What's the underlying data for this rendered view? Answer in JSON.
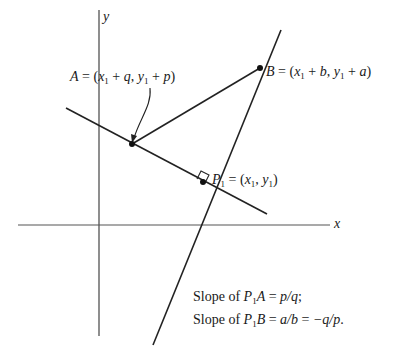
{
  "figure": {
    "axes": {
      "x_label": "x",
      "y_label": "y"
    },
    "points": {
      "A": {
        "name": "A",
        "x_expr": "x",
        "x_sub": "1",
        "x_plus": "q",
        "y_expr": "y",
        "y_sub": "1",
        "y_plus": "p"
      },
      "B": {
        "name": "B",
        "x_expr": "x",
        "x_sub": "1",
        "x_plus": "b",
        "y_expr": "y",
        "y_sub": "1",
        "y_plus": "a"
      },
      "P1": {
        "name": "P",
        "name_sub": "1",
        "x_expr": "x",
        "x_sub": "1",
        "y_expr": "y",
        "y_sub": "1"
      }
    },
    "annotations": {
      "line1": {
        "prefix": "Slope of ",
        "seg_P": "P",
        "seg_sub": "1",
        "seg_end": "A",
        "eq": " = ",
        "value": "p/q",
        "suffix": ";"
      },
      "line2": {
        "prefix": "Slope of ",
        "seg_P": "P",
        "seg_sub": "1",
        "seg_end": "B",
        "eq": " = ",
        "value1": "a/b",
        "eq2": " = ",
        "value2": "−q/p",
        "suffix": "."
      }
    },
    "symbols": {
      "equals": " = ",
      "open": "(",
      "close": ")",
      "comma": ", ",
      "plus": " + "
    }
  }
}
